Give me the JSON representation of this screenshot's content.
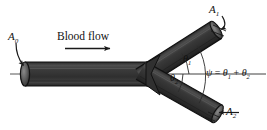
{
  "figure": {
    "name": "blood-vessel-bifurcation-diagram",
    "background_color": "#ffffff",
    "pipe_color": "#3a3a3a",
    "pipe_edge_color": "#111111",
    "line_color": "#222222"
  },
  "labels": {
    "area_inlet": "A",
    "area_inlet_sub": "0",
    "area_branch1": "A",
    "area_branch1_sub": "1",
    "area_branch2": "A",
    "area_branch2_sub": "2",
    "theta1": "θ",
    "theta1_sub": "1",
    "theta2": "θ",
    "theta2_sub": "2",
    "flow_text": "Blood flow",
    "equation_psi": "ψ",
    "equation_equals": "=",
    "equation_theta1": "θ",
    "equation_theta1_sub": "1",
    "equation_plus": "+",
    "equation_theta2": "θ",
    "equation_theta2_sub": "2"
  },
  "geometry": {
    "junction_x": 147,
    "junction_y": 74,
    "inlet_cap_x": 25,
    "inlet_cap_y": 74,
    "branch1_end_x": 215,
    "branch1_end_y": 30,
    "branch2_end_x": 214,
    "branch2_end_y": 113,
    "theta1_degrees": 33,
    "theta2_degrees": 30,
    "psi_degrees": 63
  },
  "arrows": {
    "flow_arrow_label": "flow-direction-arrow",
    "a0_arrow_label": "a0-pointer-arrow",
    "a1_arrow_label": "a1-pointer-arrow",
    "a2_arrow_label": "a2-pointer-arrow"
  }
}
